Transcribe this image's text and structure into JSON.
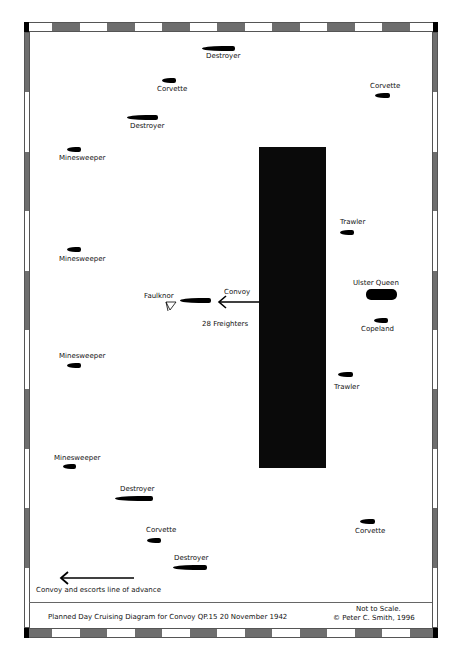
{
  "diagram": {
    "title": "Planned Day Cruising Diagram for Convoy QP.15 20 November 1942",
    "scale_note": "Not to Scale.",
    "copyright": "© Peter C. Smith, 1996",
    "legend": "Convoy and escorts line of advance",
    "convoy": {
      "label": "Convoy",
      "count_label": "28 Freighters",
      "block_color": "#0a0a0a"
    },
    "ships": [
      {
        "name": "Destroyer",
        "x": 202,
        "y": 46,
        "w": 33,
        "h": 5,
        "label_x": 206,
        "label_y": 53
      },
      {
        "name": "Corvette",
        "x": 162,
        "y": 78,
        "w": 14,
        "h": 5,
        "label_x": 157,
        "label_y": 86
      },
      {
        "name": "Corvette",
        "x": 375,
        "y": 93,
        "w": 15,
        "h": 5,
        "label_x": 370,
        "label_y": 83
      },
      {
        "name": "Destroyer",
        "x": 127,
        "y": 115,
        "w": 31,
        "h": 5,
        "label_x": 130,
        "label_y": 123
      },
      {
        "name": "Minesweeper",
        "x": 67,
        "y": 147,
        "w": 14,
        "h": 5,
        "label_x": 59,
        "label_y": 155
      },
      {
        "name": "Minesweeper",
        "x": 67,
        "y": 247,
        "w": 14,
        "h": 5,
        "label_x": 59,
        "label_y": 256
      },
      {
        "name": "Trawler",
        "x": 340,
        "y": 230,
        "w": 14,
        "h": 5,
        "label_x": 340,
        "label_y": 219
      },
      {
        "name": "Ulster Queen",
        "x": 366,
        "y": 289,
        "w": 31,
        "h": 11,
        "label_x": 353,
        "label_y": 280
      },
      {
        "name": "Faulknor",
        "x": 180,
        "y": 298,
        "w": 31,
        "h": 5,
        "label_x": 144,
        "label_y": 293
      },
      {
        "name": "Copeland",
        "x": 374,
        "y": 318,
        "w": 14,
        "h": 5,
        "label_x": 361,
        "label_y": 326
      },
      {
        "name": "Minesweeper",
        "x": 67,
        "y": 363,
        "w": 14,
        "h": 5,
        "label_x": 59,
        "label_y": 353
      },
      {
        "name": "Trawler",
        "x": 338,
        "y": 372,
        "w": 15,
        "h": 5,
        "label_x": 334,
        "label_y": 384
      },
      {
        "name": "Minesweeper",
        "x": 63,
        "y": 464,
        "w": 13,
        "h": 5,
        "label_x": 54,
        "label_y": 455
      },
      {
        "name": "Destroyer",
        "x": 115,
        "y": 496,
        "w": 38,
        "h": 5,
        "label_x": 120,
        "label_y": 486
      },
      {
        "name": "Corvette",
        "x": 360,
        "y": 519,
        "w": 15,
        "h": 5,
        "label_x": 355,
        "label_y": 528
      },
      {
        "name": "Corvette",
        "x": 147,
        "y": 538,
        "w": 14,
        "h": 5,
        "label_x": 146,
        "label_y": 527
      },
      {
        "name": "Destroyer",
        "x": 173,
        "y": 565,
        "w": 34,
        "h": 5,
        "label_x": 174,
        "label_y": 555
      }
    ],
    "colors": {
      "border_grey": "#6e6e6e",
      "border_white": "#ffffff",
      "ink": "#000000"
    }
  }
}
